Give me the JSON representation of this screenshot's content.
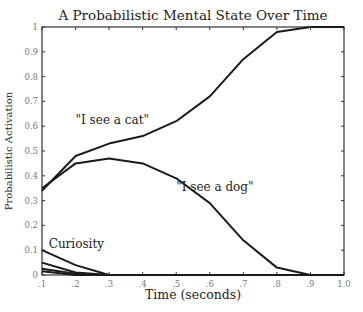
{
  "chart_data": {
    "type": "line",
    "title": "A Probabilistic Mental State Over Time",
    "xlabel": "Time (seconds)",
    "ylabel": "Probabilistic Activation",
    "x": [
      0.1,
      0.2,
      0.3,
      0.4,
      0.5,
      0.6,
      0.7,
      0.8,
      0.9,
      1.0
    ],
    "xlim": [
      0.1,
      1.0
    ],
    "ylim": [
      0,
      1
    ],
    "x_tick_labels": [
      ".1",
      ".2",
      ".3",
      ".4",
      ".5",
      ".6",
      ".7",
      ".8",
      ".9",
      "1.0"
    ],
    "y_tick_labels": [
      "0",
      "0.1",
      "0.2",
      "0.3",
      "0.4",
      "0.5",
      "0.6",
      "0.7",
      "0.8",
      "0.9",
      "1"
    ],
    "grid": false,
    "legend": "none (inline annotations)",
    "series": [
      {
        "name": "\"I see a cat\"",
        "values": [
          0.34,
          0.48,
          0.53,
          0.56,
          0.62,
          0.72,
          0.87,
          0.98,
          1.0,
          1.0
        ],
        "label_pos": [
          0.2,
          0.61
        ]
      },
      {
        "name": "\"I see a dog\"",
        "values": [
          0.35,
          0.45,
          0.47,
          0.45,
          0.39,
          0.29,
          0.14,
          0.03,
          0.0,
          0.0
        ],
        "label_pos": [
          0.5,
          0.34
        ]
      },
      {
        "name": "Curiosity",
        "values": [
          0.1,
          0.04,
          0.0,
          0.0,
          0.0,
          0.0,
          0.0,
          0.0,
          0.0,
          0.0
        ],
        "label_pos": [
          0.12,
          0.11
        ]
      },
      {
        "name": "minor state 1",
        "values": [
          0.05,
          0.01,
          0.0,
          0.0,
          0.0,
          0.0,
          0.0,
          0.0,
          0.0,
          0.0
        ]
      },
      {
        "name": "minor state 2",
        "values": [
          0.025,
          0.005,
          0.0,
          0.0,
          0.0,
          0.0,
          0.0,
          0.0,
          0.0,
          0.0
        ]
      },
      {
        "name": "minor state 3",
        "values": [
          0.015,
          0.0,
          0.0,
          0.0,
          0.0,
          0.0,
          0.0,
          0.0,
          0.0,
          0.0
        ]
      }
    ],
    "annotations": [
      "\"I see a cat\"",
      "\"I see a dog\"",
      "Curiosity"
    ],
    "line_color": "#1a1a1a"
  }
}
